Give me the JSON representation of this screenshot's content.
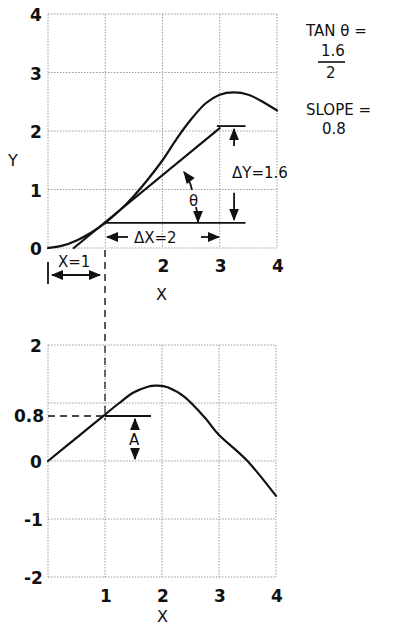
{
  "chart_data": [
    {
      "type": "line",
      "name": "function",
      "xlabel": "X",
      "ylabel": "Y",
      "xlim": [
        0,
        4
      ],
      "ylim": [
        0,
        4
      ],
      "xticks": [
        "",
        "",
        "2",
        "3",
        "4"
      ],
      "yticks": [
        "0",
        "1",
        "2",
        "3",
        "4"
      ],
      "grid": true,
      "series": [
        {
          "name": "curve",
          "x": [
            0,
            0.25,
            0.5,
            0.75,
            1.0,
            1.25,
            1.5,
            1.75,
            2.0,
            2.25,
            2.5,
            2.75,
            3.0,
            3.25,
            3.5,
            3.75,
            4.0
          ],
          "y": [
            0,
            0.04,
            0.13,
            0.26,
            0.43,
            0.64,
            0.89,
            1.18,
            1.5,
            1.87,
            2.2,
            2.47,
            2.62,
            2.66,
            2.62,
            2.5,
            2.35
          ]
        },
        {
          "name": "tangent",
          "x": [
            0.45,
            3.0
          ],
          "y": [
            0.0,
            2.05
          ]
        }
      ],
      "tangent_point": {
        "x": 1,
        "y": 0.43
      },
      "annotations": {
        "delta_x": "ΔX=2",
        "delta_y": "ΔY=1.6",
        "theta": "θ",
        "x_eq": "X=1"
      }
    },
    {
      "type": "line",
      "name": "derivative",
      "xlabel": "X",
      "ylabel": "",
      "xlim": [
        0,
        4
      ],
      "ylim": [
        -2,
        2
      ],
      "xticks": [
        "1",
        "2",
        "3",
        "4"
      ],
      "yticks": [
        "-2",
        "-1",
        "0",
        "2"
      ],
      "extra_ytick": "0.8",
      "grid": true,
      "series": [
        {
          "name": "slope",
          "x": [
            0,
            0.5,
            1.0,
            1.25,
            1.5,
            1.75,
            1.9,
            2.1,
            2.4,
            2.75,
            3.0,
            3.5,
            4.0
          ],
          "y": [
            0,
            0.4,
            0.8,
            1.0,
            1.18,
            1.28,
            1.3,
            1.27,
            1.1,
            0.75,
            0.45,
            0.0,
            -0.6
          ]
        }
      ],
      "marked_point": {
        "x": 1,
        "y": 0.8
      },
      "annotations": {
        "a_label": "A"
      }
    }
  ],
  "side_note": {
    "tan_line": "TAN θ =",
    "numerator": "1.6",
    "denominator": "2",
    "slope_line": "SLOPE =",
    "slope_value": "0.8"
  }
}
